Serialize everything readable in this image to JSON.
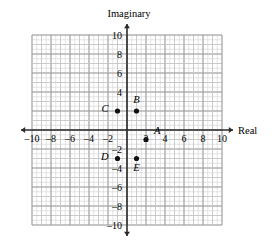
{
  "figure": {
    "axis_titles": {
      "x": "Real",
      "y": "Imaginary"
    },
    "x_ticks": [
      "-10",
      "-8",
      "-6",
      "-4",
      "-2",
      "2",
      "4",
      "6",
      "8",
      "10"
    ],
    "y_ticks": [
      "10",
      "8",
      "6",
      "4",
      "-2",
      "-4",
      "-6",
      "-8",
      "-10"
    ],
    "point_labels": {
      "A": "A",
      "B": "B",
      "C": "C",
      "D": "D",
      "E": "E"
    },
    "colors": {
      "grid_minor": "#d8d8d8",
      "grid_major": "#9a9a9a",
      "axis": "#2b2b2b",
      "point": "#111111",
      "background": "#ffffff"
    }
  },
  "chart_data": {
    "type": "scatter",
    "title": "",
    "xlabel": "Real",
    "ylabel": "Imaginary",
    "xlim": [
      -10,
      10
    ],
    "ylim": [
      -10,
      10
    ],
    "grid": true,
    "legend": "none",
    "x_tick_values": [
      -10,
      -8,
      -6,
      -4,
      -2,
      2,
      4,
      6,
      8,
      10
    ],
    "y_tick_values": [
      10,
      8,
      6,
      4,
      -2,
      -4,
      -6,
      -8,
      -10
    ],
    "points": [
      {
        "label": "A",
        "x": 2,
        "y": -1,
        "label_dx": 8,
        "label_dy": -6
      },
      {
        "label": "B",
        "x": 1,
        "y": 2,
        "label_dx": 0,
        "label_dy": -8
      },
      {
        "label": "C",
        "x": -1,
        "y": 2,
        "label_dx": -9,
        "label_dy": 1
      },
      {
        "label": "D",
        "x": -1,
        "y": -3,
        "label_dx": -9,
        "label_dy": 1
      },
      {
        "label": "E",
        "x": 1,
        "y": -3,
        "label_dx": 0,
        "label_dy": 12
      }
    ]
  }
}
